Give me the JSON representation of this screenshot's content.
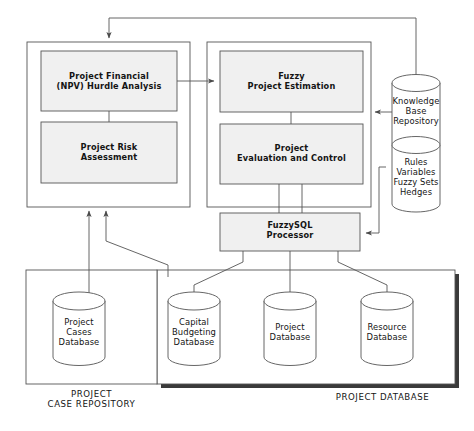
{
  "diagram": {
    "colors": {
      "stroke": "#555555",
      "box_fill": "#f0f0f0",
      "panel_fill": "#ffffff",
      "cylinder_fill": "#ffffff",
      "text": "#141414",
      "shadow": "#3a3a3a"
    },
    "panels": [
      {
        "id": "project-analysis-panel",
        "caption": "",
        "boxes": [
          {
            "id": "npv-hurdle-analysis",
            "label": "Project  Financial\n(NPV)  Hurdle  Analysis"
          },
          {
            "id": "project-risk-assessment",
            "label": "Project  Risk\nAssessment"
          }
        ]
      },
      {
        "id": "fuzzy-estimation-panel",
        "caption": "",
        "boxes": [
          {
            "id": "fuzzy-project-estimation",
            "label": "Fuzzy\nProject  Estimation"
          },
          {
            "id": "project-evaluation-control",
            "label": "Project\nEvaluation  and  Control"
          }
        ]
      }
    ],
    "processor": {
      "id": "fuzzysql-processor",
      "label": "FuzzySQL\nProcessor"
    },
    "repositories": [
      {
        "id": "knowledge-base-repository",
        "label": "Knowledge\nBase\nRepository"
      },
      {
        "id": "rules-variables-fuzzy-sets-hedges",
        "label": "Rules\nVariables\nFuzzy  Sets\nHedges"
      }
    ],
    "case_repository": {
      "id": "project-case-repository",
      "caption": "PROJECT\nCASE  REPOSITORY",
      "databases": [
        {
          "id": "project-cases-database",
          "label": "Project\nCases\nDatabase"
        }
      ]
    },
    "project_database": {
      "id": "project-database-group",
      "caption": "PROJECT  DATABASE",
      "databases": [
        {
          "id": "capital-budgeting-database",
          "label": "Capital\nBudgeting\nDatabase"
        },
        {
          "id": "project-database",
          "label": "Project\nDatabase"
        },
        {
          "id": "resource-database",
          "label": "Resource\nDatabase"
        }
      ]
    }
  }
}
